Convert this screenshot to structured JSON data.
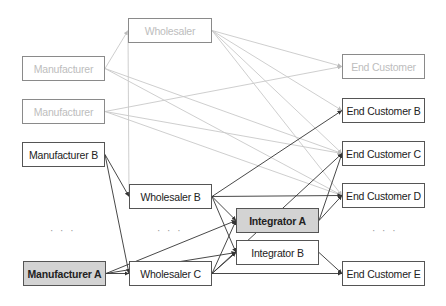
{
  "diagram": {
    "type": "supply-chain-network",
    "colors": {
      "faded_line": "#c8c8c8",
      "active_line": "#333333",
      "highlight_fill": "#d3d3d3"
    },
    "nodes": [
      {
        "id": "w0",
        "label": "Wholesaler",
        "state": "faded",
        "x": 128,
        "y": 18,
        "w": 84,
        "h": 25
      },
      {
        "id": "m1",
        "label": "Manufacturer",
        "state": "faded",
        "x": 22,
        "y": 56,
        "w": 83,
        "h": 25
      },
      {
        "id": "m2",
        "label": "Manufacturer",
        "state": "faded",
        "x": 22,
        "y": 99,
        "w": 83,
        "h": 25
      },
      {
        "id": "mb",
        "label": "Manufacturer B",
        "state": "normal",
        "x": 22,
        "y": 142,
        "w": 83,
        "h": 25
      },
      {
        "id": "wb",
        "label": "Wholesaler B",
        "state": "normal",
        "x": 129,
        "y": 184,
        "w": 83,
        "h": 25
      },
      {
        "id": "ma",
        "label": "Manufacturer A",
        "state": "highlight",
        "x": 23,
        "y": 261,
        "w": 83,
        "h": 25
      },
      {
        "id": "wc",
        "label": "Wholesaler C",
        "state": "normal",
        "x": 129,
        "y": 261,
        "w": 83,
        "h": 25
      },
      {
        "id": "ia",
        "label": "Integrator A",
        "state": "highlight",
        "x": 236,
        "y": 208,
        "w": 83,
        "h": 25
      },
      {
        "id": "ib",
        "label": "Integrator B",
        "state": "normal",
        "x": 236,
        "y": 240,
        "w": 83,
        "h": 25
      },
      {
        "id": "e0",
        "label": "End Customer",
        "state": "faded",
        "x": 342,
        "y": 54,
        "w": 83,
        "h": 25
      },
      {
        "id": "eb",
        "label": "End Customer B",
        "state": "normal",
        "x": 342,
        "y": 98,
        "w": 83,
        "h": 25
      },
      {
        "id": "ec",
        "label": "End Customer C",
        "state": "normal",
        "x": 342,
        "y": 141,
        "w": 83,
        "h": 25
      },
      {
        "id": "ed",
        "label": "End Customer D",
        "state": "normal",
        "x": 342,
        "y": 183,
        "w": 83,
        "h": 25
      },
      {
        "id": "ee",
        "label": "End Customer E",
        "state": "normal",
        "x": 342,
        "y": 261,
        "w": 83,
        "h": 25
      }
    ],
    "ellipses": [
      {
        "id": "manufacturers-more",
        "label": "· · ·",
        "x": 50,
        "y": 225
      },
      {
        "id": "wholesalers-more",
        "label": "· · ·",
        "x": 157,
        "y": 225
      },
      {
        "id": "customers-more",
        "label": "· · ·",
        "x": 372,
        "y": 225
      }
    ],
    "edges": [
      {
        "from": "m1",
        "to": "w0",
        "style": "faded"
      },
      {
        "from": "m1",
        "to": "ec",
        "style": "faded"
      },
      {
        "from": "m1",
        "to": "ed",
        "style": "faded"
      },
      {
        "from": "m2",
        "to": "e0",
        "style": "faded"
      },
      {
        "from": "m2",
        "to": "ec",
        "style": "faded"
      },
      {
        "from": "m2",
        "to": "ed",
        "style": "faded"
      },
      {
        "from": "w0",
        "to": "e0",
        "style": "faded"
      },
      {
        "from": "w0",
        "to": "eb",
        "style": "faded"
      },
      {
        "from": "w0",
        "to": "ec",
        "style": "faded"
      },
      {
        "from": "w0",
        "to": "ed",
        "style": "faded"
      },
      {
        "from": "w0",
        "to": "wb",
        "style": "faded",
        "note": "line from Wholesaler left edge down to Wholesaler B"
      },
      {
        "from": "mb",
        "to": "wb",
        "style": "active"
      },
      {
        "from": "mb",
        "to": "wc",
        "style": "active"
      },
      {
        "from": "ma",
        "to": "wc",
        "style": "active"
      },
      {
        "from": "ma",
        "to": "ia",
        "style": "active"
      },
      {
        "from": "ma",
        "to": "ib",
        "style": "active"
      },
      {
        "from": "wb",
        "to": "eb",
        "style": "active"
      },
      {
        "from": "wb",
        "to": "ed",
        "style": "active"
      },
      {
        "from": "wb",
        "to": "ia",
        "style": "active"
      },
      {
        "from": "wb",
        "to": "ib",
        "style": "active"
      },
      {
        "from": "wc",
        "to": "ia",
        "style": "active"
      },
      {
        "from": "wc",
        "to": "ib",
        "style": "active"
      },
      {
        "from": "wc",
        "to": "ec",
        "style": "active"
      },
      {
        "from": "wc",
        "to": "ee",
        "style": "active"
      },
      {
        "from": "ia",
        "to": "ec",
        "style": "active"
      },
      {
        "from": "ia",
        "to": "ed",
        "style": "active"
      },
      {
        "from": "ib",
        "to": "ee",
        "style": "active"
      }
    ]
  }
}
